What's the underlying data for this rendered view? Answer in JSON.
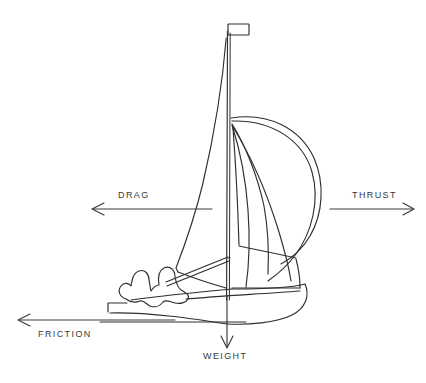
{
  "diagram": {
    "background_color": "#ffffff",
    "ink_color": "#2e2e33",
    "label_color": "#3a3a3a",
    "width": 426,
    "height": 383,
    "forces": [
      {
        "id": "drag",
        "label": "DRAG",
        "direction": "left",
        "label_position": "above-line",
        "arrow_tip": [
          92,
          209
        ],
        "arrow_tail": [
          212,
          209
        ]
      },
      {
        "id": "thrust",
        "label": "THRUST",
        "direction": "right",
        "label_position": "above-line",
        "arrow_tip": [
          414,
          209
        ],
        "arrow_tail": [
          330,
          209
        ]
      },
      {
        "id": "friction",
        "label": "FRICTION",
        "direction": "left",
        "label_position": "below-line",
        "arrow_tip": [
          18,
          320
        ],
        "arrow_tail": [
          175,
          320
        ]
      },
      {
        "id": "weight",
        "label": "WEIGHT",
        "direction": "down",
        "label_position": "below-arrow",
        "arrow_tip": [
          227,
          348
        ],
        "arrow_tail": [
          227,
          296
        ]
      }
    ],
    "boat_parts": [
      "flag",
      "mast",
      "mainsail",
      "spinnaker",
      "jib",
      "boom",
      "hull",
      "waterline",
      "crew"
    ]
  }
}
